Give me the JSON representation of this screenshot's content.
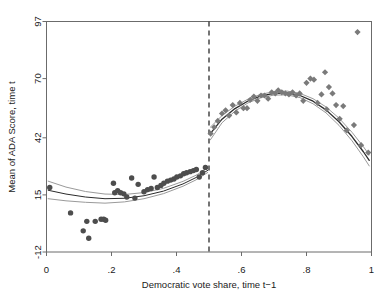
{
  "chart_data": {
    "type": "scatter",
    "title": "",
    "subtitle": "",
    "xlabel": "Democratic vote share, time t−1",
    "ylabel": "Mean of ADA Score, time t",
    "xlim": [
      0,
      1
    ],
    "ylim": [
      -12,
      97
    ],
    "grid": false,
    "legend": null,
    "xticks": [
      0,
      0.2,
      0.4,
      0.6,
      0.8,
      1
    ],
    "xticklabels": [
      "0",
      ".2",
      ".4",
      ".6",
      ".8",
      "1"
    ],
    "yticks": [
      -12,
      15,
      42,
      70,
      97
    ],
    "yticklabels": [
      "-12",
      "15",
      "42",
      "70",
      "97"
    ],
    "annotations": [
      {
        "name": "threshold-line",
        "kind": "vline",
        "x": 0.5,
        "style": "dashed",
        "color": "#3a3a3a"
      }
    ],
    "series": [
      {
        "name": "Binned means, left of threshold",
        "marker": "circle",
        "color": "#4d4d4d",
        "points": [
          [
            0.01,
            18.5
          ],
          [
            0.074,
            6.5
          ],
          [
            0.113,
            -2.0
          ],
          [
            0.124,
            2.5
          ],
          [
            0.13,
            -5.5
          ],
          [
            0.15,
            2.5
          ],
          [
            0.168,
            3.5
          ],
          [
            0.176,
            3.5
          ],
          [
            0.182,
            3.0
          ],
          [
            0.206,
            20.5
          ],
          [
            0.21,
            16.0
          ],
          [
            0.219,
            17.0
          ],
          [
            0.228,
            16.0
          ],
          [
            0.238,
            15.5
          ],
          [
            0.247,
            14.0
          ],
          [
            0.262,
            23.0
          ],
          [
            0.272,
            13.5
          ],
          [
            0.282,
            20.0
          ],
          [
            0.3,
            16.5
          ],
          [
            0.311,
            17.5
          ],
          [
            0.322,
            18.0
          ],
          [
            0.331,
            23.5
          ],
          [
            0.341,
            18.5
          ],
          [
            0.352,
            19.5
          ],
          [
            0.361,
            20.5
          ],
          [
            0.372,
            21.5
          ],
          [
            0.382,
            22.0
          ],
          [
            0.392,
            22.5
          ],
          [
            0.401,
            23.5
          ],
          [
            0.412,
            24.0
          ],
          [
            0.422,
            25.0
          ],
          [
            0.431,
            25.5
          ],
          [
            0.442,
            26.0
          ],
          [
            0.452,
            26.5
          ],
          [
            0.461,
            27.0
          ],
          [
            0.47,
            23.5
          ],
          [
            0.48,
            25.5
          ],
          [
            0.489,
            28.0
          ]
        ]
      },
      {
        "name": "Binned means, right of threshold",
        "marker": "diamond",
        "color": "#7a7a7a",
        "points": [
          [
            0.505,
            44.0
          ],
          [
            0.516,
            47.0
          ],
          [
            0.527,
            50.0
          ],
          [
            0.54,
            53.5
          ],
          [
            0.551,
            55.0
          ],
          [
            0.562,
            52.5
          ],
          [
            0.573,
            57.5
          ],
          [
            0.584,
            54.0
          ],
          [
            0.595,
            58.5
          ],
          [
            0.606,
            56.0
          ],
          [
            0.617,
            56.0
          ],
          [
            0.627,
            60.0
          ],
          [
            0.638,
            61.5
          ],
          [
            0.649,
            59.5
          ],
          [
            0.66,
            62.0
          ],
          [
            0.671,
            62.0
          ],
          [
            0.682,
            60.5
          ],
          [
            0.693,
            63.5
          ],
          [
            0.704,
            63.0
          ],
          [
            0.713,
            64.5
          ],
          [
            0.724,
            63.5
          ],
          [
            0.735,
            63.0
          ],
          [
            0.746,
            62.5
          ],
          [
            0.757,
            63.5
          ],
          [
            0.768,
            62.0
          ],
          [
            0.779,
            63.0
          ],
          [
            0.79,
            59.5
          ],
          [
            0.8,
            68.0
          ],
          [
            0.812,
            70.0
          ],
          [
            0.823,
            69.5
          ],
          [
            0.834,
            58.5
          ],
          [
            0.846,
            62.5
          ],
          [
            0.857,
            73.0
          ],
          [
            0.862,
            55.5
          ],
          [
            0.869,
            66.0
          ],
          [
            0.88,
            63.0
          ],
          [
            0.891,
            57.5
          ],
          [
            0.902,
            51.0
          ],
          [
            0.913,
            57.0
          ],
          [
            0.924,
            45.5
          ],
          [
            0.946,
            48.0
          ],
          [
            0.957,
            92.0
          ],
          [
            0.968,
            38.5
          ],
          [
            0.99,
            35.0
          ]
        ]
      }
    ],
    "fits": [
      {
        "name": "Fitted polynomial, left of threshold",
        "kind": "line",
        "color": "#2b2b2b",
        "width": 1.0,
        "points": [
          [
            0.005,
            17.2
          ],
          [
            0.06,
            15.4
          ],
          [
            0.12,
            14.0
          ],
          [
            0.18,
            13.2
          ],
          [
            0.24,
            13.4
          ],
          [
            0.3,
            14.6
          ],
          [
            0.36,
            16.8
          ],
          [
            0.42,
            20.2
          ],
          [
            0.46,
            23.2
          ],
          [
            0.496,
            26.6
          ]
        ]
      },
      {
        "name": "Upper confidence band, left of threshold",
        "kind": "line",
        "color": "#9a9a9a",
        "width": 1.0,
        "points": [
          [
            0.005,
            21.5
          ],
          [
            0.06,
            18.7
          ],
          [
            0.12,
            16.6
          ],
          [
            0.18,
            15.4
          ],
          [
            0.24,
            15.2
          ],
          [
            0.3,
            16.1
          ],
          [
            0.36,
            18.1
          ],
          [
            0.42,
            21.4
          ],
          [
            0.46,
            24.3
          ],
          [
            0.496,
            27.6
          ]
        ]
      },
      {
        "name": "Lower confidence band, left of threshold",
        "kind": "line",
        "color": "#9a9a9a",
        "width": 1.0,
        "points": [
          [
            0.005,
            13.2
          ],
          [
            0.06,
            12.2
          ],
          [
            0.12,
            11.5
          ],
          [
            0.18,
            11.1
          ],
          [
            0.24,
            11.7
          ],
          [
            0.3,
            13.2
          ],
          [
            0.36,
            15.6
          ],
          [
            0.42,
            19.1
          ],
          [
            0.46,
            22.1
          ],
          [
            0.496,
            25.6
          ]
        ]
      },
      {
        "name": "Fitted polynomial, right of threshold",
        "kind": "line",
        "color": "#2b2b2b",
        "width": 1.3,
        "points": [
          [
            0.504,
            44.0
          ],
          [
            0.54,
            50.8
          ],
          [
            0.58,
            55.8
          ],
          [
            0.62,
            59.4
          ],
          [
            0.66,
            61.8
          ],
          [
            0.7,
            63.0
          ],
          [
            0.74,
            63.2
          ],
          [
            0.78,
            62.0
          ],
          [
            0.82,
            59.3
          ],
          [
            0.86,
            55.2
          ],
          [
            0.9,
            49.6
          ],
          [
            0.94,
            42.6
          ],
          [
            0.975,
            35.4
          ],
          [
            0.993,
            31.3
          ]
        ]
      },
      {
        "name": "Upper confidence band, right of threshold",
        "kind": "line",
        "color": "#9a9a9a",
        "width": 1.0,
        "points": [
          [
            0.504,
            47.0
          ],
          [
            0.54,
            52.5
          ],
          [
            0.58,
            57.0
          ],
          [
            0.62,
            60.3
          ],
          [
            0.66,
            62.6
          ],
          [
            0.7,
            63.8
          ],
          [
            0.74,
            64.1
          ],
          [
            0.78,
            63.0
          ],
          [
            0.82,
            60.5
          ],
          [
            0.86,
            56.6
          ],
          [
            0.9,
            51.3
          ],
          [
            0.94,
            44.6
          ],
          [
            0.975,
            37.8
          ],
          [
            0.993,
            33.9
          ]
        ]
      },
      {
        "name": "Lower confidence band, right of threshold",
        "kind": "line",
        "color": "#9a9a9a",
        "width": 1.0,
        "points": [
          [
            0.504,
            41.0
          ],
          [
            0.54,
            49.1
          ],
          [
            0.58,
            54.6
          ],
          [
            0.62,
            58.5
          ],
          [
            0.66,
            61.0
          ],
          [
            0.7,
            62.2
          ],
          [
            0.74,
            62.3
          ],
          [
            0.78,
            61.0
          ],
          [
            0.82,
            58.1
          ],
          [
            0.86,
            53.8
          ],
          [
            0.9,
            47.9
          ],
          [
            0.94,
            40.6
          ],
          [
            0.975,
            33.0
          ],
          [
            0.993,
            28.7
          ]
        ]
      }
    ]
  },
  "axes": {
    "x_title": "Democratic vote share, time t−1",
    "y_title": "Mean of ADA Score, time t",
    "x_tick_labels": [
      "0",
      ".2",
      ".4",
      ".6",
      ".8",
      "1"
    ],
    "y_tick_labels": [
      "97",
      "70",
      "42",
      "15",
      "-12"
    ]
  },
  "colors": {
    "frame": "#6b6b6b",
    "left_marker": "#4d4d4d",
    "right_marker": "#7a7a7a",
    "fit_line": "#2b2b2b",
    "band_line": "#9a9a9a",
    "threshold": "#3a3a3a",
    "background": "#ffffff",
    "text": "#1a1a1a"
  }
}
